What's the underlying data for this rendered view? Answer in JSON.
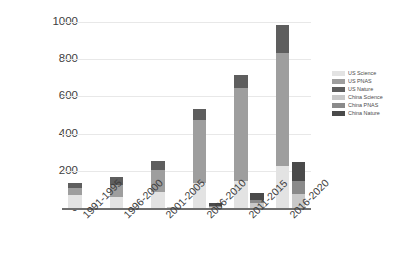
{
  "chart_data": {
    "type": "bar",
    "title": "",
    "xlabel": "",
    "ylabel": "Number of Publications",
    "ylim": [
      0,
      1000
    ],
    "yticks": [
      "0",
      "200",
      "400",
      "600",
      "800",
      "1000"
    ],
    "grid": true,
    "legend_position": "right",
    "stacked": true,
    "grouped": true,
    "categories": [
      "1991-1995",
      "1996-2000",
      "2001-2005",
      "2006-2010",
      "2011-2015",
      "2016-2020"
    ],
    "series": [
      {
        "name": "US Science",
        "color": "#e3e3e3",
        "group": "US",
        "values": [
          68,
          57,
          85,
          136,
          145,
          226
        ]
      },
      {
        "name": "US PNAS",
        "color": "#9e9e9e",
        "group": "US",
        "values": [
          41,
          67,
          120,
          337,
          500,
          607
        ]
      },
      {
        "name": "US Nature",
        "color": "#5e5e5e",
        "group": "US",
        "values": [
          26,
          41,
          50,
          57,
          70,
          152
        ]
      },
      {
        "name": "China Science",
        "color": "#c9c9c9",
        "group": "China",
        "values": [
          1,
          1,
          3,
          4,
          26,
          75
        ]
      },
      {
        "name": "China PNAS",
        "color": "#8a8a8a",
        "group": "China",
        "values": [
          0,
          0,
          1,
          6,
          16,
          70
        ]
      },
      {
        "name": "China Nature",
        "color": "#4a4a4a",
        "group": "China",
        "values": [
          0,
          0,
          1,
          18,
          40,
          105
        ]
      }
    ],
    "group_totals": {
      "US": [
        135,
        165,
        255,
        530,
        715,
        985
      ],
      "China": [
        1,
        1,
        5,
        28,
        82,
        250
      ]
    }
  },
  "legend": {
    "items": [
      {
        "label": "US Science"
      },
      {
        "label": "US PNAS"
      },
      {
        "label": "US Nature"
      },
      {
        "label": "China Science"
      },
      {
        "label": "China PNAS"
      },
      {
        "label": "China Nature"
      }
    ]
  }
}
